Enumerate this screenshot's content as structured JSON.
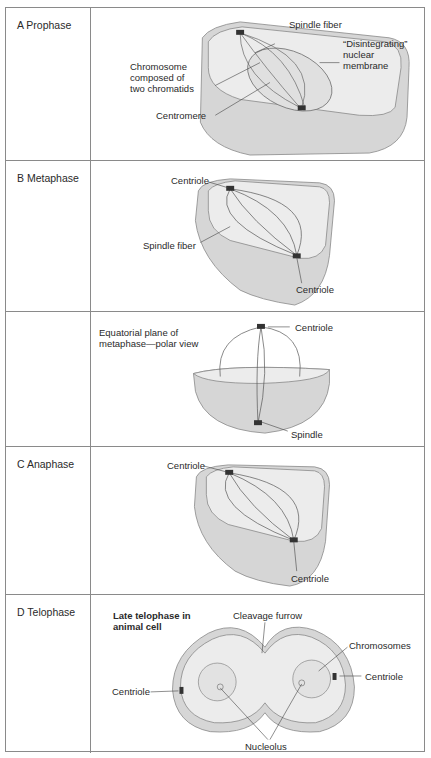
{
  "rows": [
    {
      "label": "A Prophase",
      "annotations": {
        "spindle_fiber": "Spindle fiber",
        "disintegrating_1": "“Disintegrating”",
        "disintegrating_2": "nuclear",
        "disintegrating_3": "membrane",
        "chromosome_1": "Chromosome",
        "chromosome_2": "composed of",
        "chromosome_3": "two chromatids",
        "centromere": "Centromere"
      }
    },
    {
      "label": "B Metaphase",
      "annotations": {
        "centriole_top": "Centriole",
        "spindle_fiber": "Spindle fiber",
        "centriole_bottom": "Centriole"
      }
    },
    {
      "label": "",
      "annotations": {
        "title_1": "Equatorial plane of",
        "title_2": "metaphase—polar view",
        "centriole": "Centriole",
        "spindle": "Spindle"
      }
    },
    {
      "label": "C Anaphase",
      "annotations": {
        "centriole_top": "Centriole",
        "centriole_bottom": "Centriole"
      }
    },
    {
      "label": "D Telophase",
      "annotations": {
        "title_1": "Late telophase in",
        "title_2": "animal cell",
        "cleavage_furrow": "Cleavage furrow",
        "chromosomes": "Chromosomes",
        "centriole_right": "Centriole",
        "centriole_left": "Centriole",
        "nucleolus": "Nucleolus"
      }
    }
  ],
  "colors": {
    "border": "#8a8a8a",
    "cell_fill": "#d9d9d9",
    "cell_top": "#ececec",
    "line": "#555555"
  }
}
